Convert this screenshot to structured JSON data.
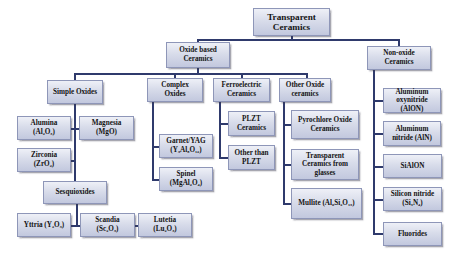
{
  "diagram": {
    "title": "Transparent Ceramics",
    "root": {
      "label": "Transparent\nCeramics"
    },
    "oxide_based": {
      "label": "Oxide based\nCeramics"
    },
    "non_oxide": {
      "label": "Non-oxide\nCeramics"
    },
    "simple_oxides": {
      "label": "Simple Oxides"
    },
    "complex_oxides": {
      "label": "Complex\nOxides"
    },
    "ferroelectric": {
      "label": "Ferroelectric\nCeramics"
    },
    "other_oxide": {
      "label": "Other Oxide\nceramics"
    },
    "alumina": {
      "label": "Alumina\n(Al₂O₃)"
    },
    "magnesia": {
      "label": "Magnesia\n(MgO)"
    },
    "zirconia": {
      "label": "Zirconia\n(ZrO₂)"
    },
    "sesquioxides": {
      "label": "Sesquioxides"
    },
    "yttria": {
      "label": "Yttria (Y₂O₃)"
    },
    "scandia": {
      "label": "Scandia\n(Sc₂O₃)"
    },
    "lutetia": {
      "label": "Lutetia\n(Lu₂O₃)"
    },
    "garnet": {
      "label": "Garnet/YAG\n(Y₃Al₅O₁₂)"
    },
    "spinel": {
      "label": "Spinel\n(MgAl₂O₄)"
    },
    "plzt": {
      "label": "PLZT\nCeramics"
    },
    "other_plzt": {
      "label": "Other than\nPLZT"
    },
    "pyrochlore": {
      "label": "Pyrochlore Oxide\nCeramics"
    },
    "glasses": {
      "label": "Transparent\nCeramics from\nglasses"
    },
    "mullite": {
      "label": "Mullite (Al₆Si₂O₁₃)"
    },
    "alon": {
      "label": "Aluminum\noxynitride\n(AlON)"
    },
    "aln": {
      "label": "Aluminum\nnitride (AlN)"
    },
    "sialon": {
      "label": "SiAlON"
    },
    "silicon_nitride": {
      "label": "Silicon nitride\n(Si₃N₄)"
    },
    "fluorides": {
      "label": "Fluorides"
    }
  },
  "colors": {
    "connector": "#2f3a6c",
    "box_fill_top": "#eef0f7",
    "box_fill_bottom": "#c2c8de",
    "text": "#141414"
  }
}
